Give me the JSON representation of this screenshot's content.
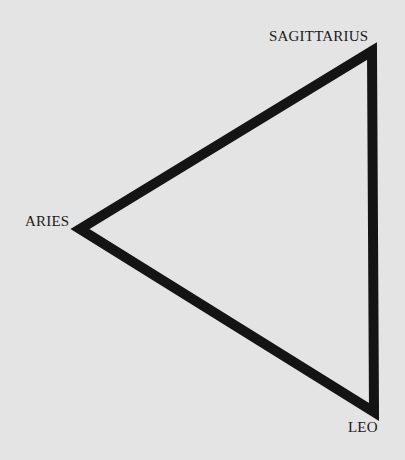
{
  "diagram": {
    "type": "triangle",
    "title": "",
    "stroke_color": "#141414",
    "background_color": "#e4e4e4",
    "vertices": [
      {
        "label": "SAGITTARIUS",
        "x": 372,
        "y": 51
      },
      {
        "label": "ARIES",
        "x": 80,
        "y": 229
      },
      {
        "label": "LEO",
        "x": 374,
        "y": 412
      }
    ]
  },
  "labels": {
    "sagittarius": "SAGITTARIUS",
    "aries": "ARIES",
    "leo": "LEO"
  }
}
